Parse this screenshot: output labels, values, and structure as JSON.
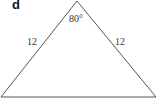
{
  "panel": {
    "label": "d"
  },
  "triangle": {
    "vertices": {
      "apex": [
        77,
        1
      ],
      "left": [
        1,
        97
      ],
      "right": [
        156,
        97
      ]
    },
    "stroke_color": "#555555",
    "labels": {
      "apex_angle": "80°",
      "left_side": "12",
      "right_side": "12"
    }
  }
}
